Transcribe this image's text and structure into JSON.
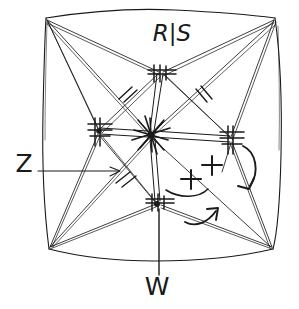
{
  "figure": {
    "kind": "hand-drawn-sketch",
    "background_color": "#ffffff",
    "ink_color": "#1a1a1a",
    "canvas": {
      "width": 299,
      "height": 309
    }
  },
  "labels": {
    "top": "R|S",
    "left": "Z",
    "bottom": "W",
    "plus_upper": "+",
    "plus_lower": "+"
  },
  "annotations": {
    "leader_left": {
      "label": "Z",
      "points_to": "left-mid-node",
      "direction": "right"
    },
    "leader_bottom": {
      "label": "W",
      "points_to": "bottom-mid-node",
      "direction": "up"
    },
    "curved_arrow_right": {
      "shape": "hook",
      "direction": "down-left"
    },
    "curved_arrow_lower": {
      "shape": "hook",
      "direction": "up-right"
    },
    "curved_arrow_under_plus": {
      "shape": "arc",
      "direction": "left"
    }
  },
  "nodes": [
    {
      "name": "center-star-node",
      "x": 150,
      "y": 134,
      "type": "star"
    },
    {
      "name": "top-mid-node",
      "x": 161,
      "y": 72,
      "type": "hatched"
    },
    {
      "name": "bottom-mid-node",
      "x": 158,
      "y": 203,
      "type": "hatched"
    },
    {
      "name": "left-mid-node",
      "x": 99,
      "y": 131,
      "type": "hatched"
    },
    {
      "name": "right-mid-node",
      "x": 230,
      "y": 139,
      "type": "hatched"
    },
    {
      "name": "corner-top-left",
      "x": 46,
      "y": 17,
      "type": "corner"
    },
    {
      "name": "corner-top-right",
      "x": 275,
      "y": 17,
      "type": "corner"
    },
    {
      "name": "corner-bottom-left",
      "x": 49,
      "y": 249,
      "type": "corner"
    },
    {
      "name": "corner-bottom-right",
      "x": 273,
      "y": 249,
      "type": "corner"
    }
  ],
  "hatch_marks": [
    {
      "name": "hatch-upper-left-strut",
      "x": 126,
      "y": 93
    },
    {
      "name": "hatch-upper-right-strut",
      "x": 201,
      "y": 95
    },
    {
      "name": "hatch-lower-left-strut",
      "x": 124,
      "y": 180
    }
  ]
}
